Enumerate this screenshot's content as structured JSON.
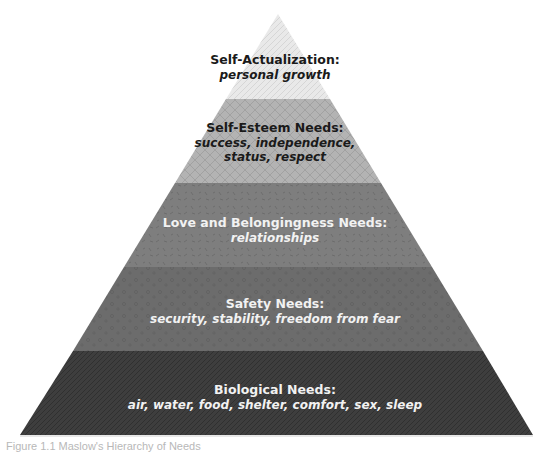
{
  "diagram": {
    "type": "pyramid",
    "tiers": [
      {
        "title": "Self-Actualization:",
        "description": "personal growth",
        "fill": "#e6e6e6",
        "pattern_color": "#bdbdbd",
        "text_color": "#1a1a1a"
      },
      {
        "title": "Self-Esteem Needs:",
        "description_lines": [
          "success, independence,",
          "status, respect"
        ],
        "fill": "#b2b2b2",
        "pattern_color": "#9a9a9a",
        "text_color": "#1a1a1a"
      },
      {
        "title": "Love and Belongingness Needs:",
        "description": "relationships",
        "fill": "#7f7f7f",
        "pattern_color": "#6a6a6a",
        "text_color": "#f2f2f2"
      },
      {
        "title": "Safety Needs:",
        "description": "security, stability, freedom from fear",
        "fill": "#6b6b6b",
        "pattern_color": "#5a5a5a",
        "text_color": "#f2f2f2"
      },
      {
        "title": "Biological Needs:",
        "description": "air, water, food, shelter, comfort, sex, sleep",
        "fill": "#3d3d3d",
        "pattern_color": "#2c2c2c",
        "text_color": "#f2f2f2"
      }
    ]
  },
  "caption": "Figure 1.1 Maslow's Hierarchy of Needs"
}
